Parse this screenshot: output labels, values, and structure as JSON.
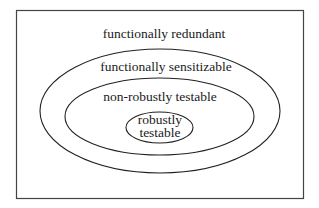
{
  "diagram": {
    "type": "nested-sets",
    "frame": {
      "x": 16,
      "y": 10,
      "width": 287,
      "height": 188,
      "stroke": "#444444"
    },
    "sets": [
      {
        "id": "functionally-redundant",
        "label": "functionally redundant",
        "shape": "frame"
      },
      {
        "id": "functionally-sensitizable",
        "label": "functionally sensitizable",
        "shape": "ellipse",
        "cx": 160,
        "cy": 111,
        "rx": 120,
        "ry": 62
      },
      {
        "id": "non-robustly-testable",
        "label": "non-robustly testable",
        "shape": "ellipse",
        "cx": 159.5,
        "cy": 116.5,
        "rx": 94.5,
        "ry": 38.5
      },
      {
        "id": "robustly-testable",
        "label_lines": [
          "robustly",
          "testable"
        ],
        "shape": "ellipse",
        "cx": 159.5,
        "cy": 127.5,
        "rx": 33.5,
        "ry": 15.5
      }
    ],
    "line_color": "#222222"
  }
}
